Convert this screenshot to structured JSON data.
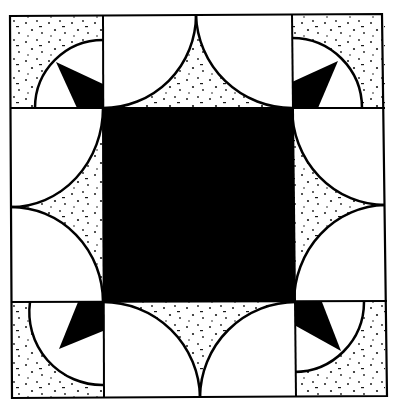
{
  "colors": {
    "background": "#ffffff",
    "ink": "#000000",
    "speckle": "#1a1a1a"
  },
  "block": {
    "grid_x": [
      11,
      103,
      292,
      385
    ],
    "grid_y": [
      15,
      108,
      302,
      397
    ],
    "center_square": "solid-black",
    "corner_cells": "speckled quarter-arc with black pinwheel wedge",
    "edge_cells": "two white quarter-circles with speckled concave triangle"
  }
}
